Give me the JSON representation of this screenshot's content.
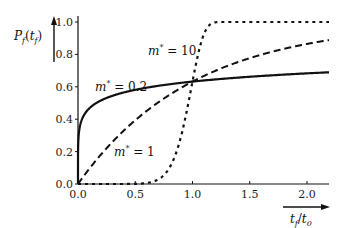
{
  "chart_data": {
    "type": "line",
    "title": "",
    "xlabel": "t_f/t_0",
    "ylabel": "P_f(t_f)",
    "xlim": [
      0,
      2.2
    ],
    "ylim": [
      0,
      1.05
    ],
    "grid": false,
    "legend": "none (inline annotations)",
    "x_ticks": [
      "0.0",
      "0.5",
      "1.0",
      "1.5",
      "2.0"
    ],
    "y_ticks": [
      "0.0",
      "0.2",
      "0.4",
      "0.6",
      "0.8",
      "1.0"
    ],
    "model": "P_f = 1 - exp(-(t_f/t_0)^m*)",
    "series": [
      {
        "name": "m* = 0.2",
        "style": "solid",
        "m": 0.2,
        "x": [
          0.0,
          0.01,
          0.1,
          0.25,
          0.5,
          0.75,
          1.0,
          1.5,
          2.0,
          2.2
        ],
        "y": [
          0.0,
          0.32,
          0.47,
          0.54,
          0.58,
          0.61,
          0.63,
          0.66,
          0.68,
          0.69
        ]
      },
      {
        "name": "m* = 1",
        "style": "dashed",
        "m": 1,
        "x": [
          0.0,
          0.25,
          0.5,
          0.75,
          1.0,
          1.5,
          2.0,
          2.2
        ],
        "y": [
          0.0,
          0.22,
          0.39,
          0.53,
          0.63,
          0.78,
          0.86,
          0.89
        ]
      },
      {
        "name": "m* = 10",
        "style": "dotted",
        "m": 10,
        "x": [
          0.0,
          0.5,
          0.7,
          0.8,
          0.9,
          1.0,
          1.1,
          1.2,
          1.5,
          2.2
        ],
        "y": [
          0.0,
          0.0,
          0.03,
          0.1,
          0.29,
          0.63,
          0.93,
          1.0,
          1.0,
          1.0
        ]
      }
    ],
    "annotations": [
      {
        "text": "m* = 0.2",
        "x": 0.35,
        "y": 0.66
      },
      {
        "text": "m* = 1",
        "x": 0.55,
        "y": 0.24
      },
      {
        "text": "m* = 10",
        "x": 0.7,
        "y": 0.83
      }
    ]
  },
  "labels": {
    "ylabel_main": "P",
    "ylabel_sub": "f",
    "ylabel_arg": "t",
    "ylabel_arg_sub": "f",
    "xlabel_num": "t",
    "xlabel_num_sub": "f",
    "xlabel_den": "t",
    "xlabel_den_sub": "0",
    "ann_m02": "m* = 0.2",
    "ann_m1": "m* = 1",
    "ann_m10": "m* = 10"
  }
}
